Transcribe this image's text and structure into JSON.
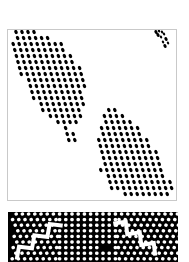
{
  "image": {
    "kind": "halftone-dither-render",
    "width": 189,
    "height": 262,
    "background_color": "#ffffff"
  },
  "panel": {
    "name": "halftone-panel",
    "x": 7,
    "y": 29,
    "width": 170,
    "height": 172,
    "fill_color": "#ffffff",
    "border_color": "#c9c9c9",
    "border_width": 1,
    "dot_color": "#000000",
    "grid": {
      "spacing_x": 6.0,
      "spacing_y": 6.0,
      "row_shear_x": 1.6,
      "dot_width": 3.2,
      "dot_height": 4.4,
      "dot_rotation_deg": -22
    },
    "shapes": [
      {
        "name": "upper-left-leaf",
        "type": "polygon",
        "points": [
          [
            6,
            2
          ],
          [
            30,
            2
          ],
          [
            56,
            14
          ],
          [
            72,
            36
          ],
          [
            78,
            62
          ],
          [
            74,
            84
          ],
          [
            66,
            96
          ],
          [
            60,
            100
          ],
          [
            52,
            96
          ],
          [
            34,
            80
          ],
          [
            18,
            58
          ],
          [
            8,
            32
          ],
          [
            4,
            12
          ]
        ]
      },
      {
        "name": "lower-right-leaf",
        "type": "polygon",
        "points": [
          [
            100,
            76
          ],
          [
            112,
            82
          ],
          [
            128,
            96
          ],
          [
            146,
            116
          ],
          [
            158,
            138
          ],
          [
            164,
            158
          ],
          [
            160,
            166
          ],
          [
            140,
            168
          ],
          [
            116,
            166
          ],
          [
            100,
            156
          ],
          [
            92,
            140
          ],
          [
            90,
            118
          ],
          [
            92,
            96
          ]
        ]
      },
      {
        "name": "upper-left-tail-speckle",
        "type": "polygon",
        "points": [
          [
            60,
            98
          ],
          [
            70,
            104
          ],
          [
            72,
            114
          ],
          [
            66,
            116
          ],
          [
            58,
            110
          ],
          [
            56,
            102
          ]
        ]
      }
    ],
    "stray_dots": {
      "name": "top-right-speckle-cluster",
      "points": [
        [
          148,
          2
        ],
        [
          151,
          1
        ],
        [
          154,
          2
        ],
        [
          150,
          5
        ],
        [
          156,
          4
        ],
        [
          153,
          7
        ],
        [
          158,
          9
        ],
        [
          155,
          12
        ],
        [
          160,
          13
        ],
        [
          157,
          16
        ]
      ]
    }
  },
  "strip": {
    "name": "inverse-halftone-strip",
    "x": 8,
    "y": 212,
    "width": 170,
    "height": 50,
    "fill_color": "#000000",
    "dot_color": "#ffffff",
    "grid": {
      "spacing_x": 6.2,
      "spacing_y": 5.6,
      "dot_width": 3.6,
      "dot_height": 3.4
    },
    "zones": [
      {
        "name": "left-diagonal-zone",
        "x_start": 0,
        "x_end": 46,
        "shear": 2.6,
        "rotation_deg": -24
      },
      {
        "name": "center-upright-zone",
        "x_start": 46,
        "x_end": 108,
        "shear": 0.0,
        "rotation_deg": 0
      },
      {
        "name": "right-diagonal-zone",
        "x_start": 108,
        "x_end": 170,
        "shear": -2.6,
        "rotation_deg": 24
      }
    ],
    "zigzag_bands": [
      {
        "name": "left-zigzag-band",
        "start": [
          6,
          44
        ],
        "end": [
          52,
          10
        ],
        "amplitude": 4.5,
        "period": 9,
        "thickness": 4.0
      },
      {
        "name": "right-zigzag-band",
        "start": [
          108,
          8
        ],
        "end": [
          150,
          40
        ],
        "amplitude": 4.5,
        "period": 9,
        "thickness": 4.0
      }
    ],
    "dark_patches": [
      {
        "name": "center-dark-block",
        "x": 95,
        "y": 34,
        "width": 9,
        "height": 7
      },
      {
        "name": "left-dark-edge",
        "x": 0,
        "y": 0,
        "width": 4,
        "height": 50
      }
    ]
  }
}
